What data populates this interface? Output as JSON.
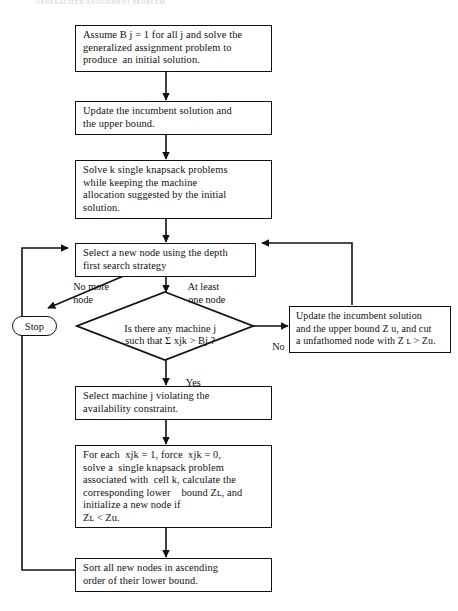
{
  "page": {
    "header_partial": "GENERALIZED ASSIGNMENT PROBLEM",
    "width": 458,
    "height": 611,
    "background": "#ffffff",
    "ink_color": "#111111"
  },
  "flowchart": {
    "type": "process-flow-diagram",
    "title": "Branch and bound algorithm for the generalized assignment problem",
    "nodes": [
      {
        "id": "init",
        "shape": "rectangle",
        "lines": [
          "Assume B j = 1 for all j and solve the",
          "generalized assignment problem to",
          "produce  an initial solution."
        ]
      },
      {
        "id": "update-incumbent",
        "shape": "rectangle",
        "lines": [
          "Update the incumbent solution and",
          "the upper bound."
        ]
      },
      {
        "id": "solve-knapsack",
        "shape": "rectangle",
        "lines": [
          "Solve k single knapsack problems",
          "while keeping the machine",
          "allocation suggested by the initial",
          "solution."
        ]
      },
      {
        "id": "select-node",
        "shape": "rectangle",
        "lines": [
          "Select a new node using the depth",
          "first search strategy"
        ]
      },
      {
        "id": "decision",
        "shape": "diamond",
        "lines": [
          "Is there any machine j",
          "such that Σ xjk > Bj ?"
        ]
      },
      {
        "id": "stop",
        "shape": "rounded-terminator",
        "lines": [
          "Stop"
        ]
      },
      {
        "id": "update-bound-cut",
        "shape": "rectangle",
        "lines": [
          "Update the incumbent solution",
          "and the upper bound Z u, and cut",
          "a unfathomed node with Z ʟ > Zu."
        ]
      },
      {
        "id": "select-machine",
        "shape": "rectangle",
        "lines": [
          "Select machine j violating the",
          "availability constraint."
        ]
      },
      {
        "id": "for-each",
        "shape": "rectangle",
        "lines": [
          "For each  xjk = 1, force  xjk = 0,",
          "solve a  single knapsack problem",
          "associated with  cell k, calculate the",
          "corresponding lower    bound Zʟ, and",
          "initialize a new node if",
          "Zʟ < Zu."
        ]
      },
      {
        "id": "sort-nodes",
        "shape": "rectangle",
        "lines": [
          "Sort all new nodes in ascending",
          "order of their lower bound."
        ]
      }
    ],
    "edge_labels": [
      {
        "id": "no-more-node",
        "lines": [
          "No more",
          "node"
        ]
      },
      {
        "id": "at-least-one-node",
        "lines": [
          "At least",
          "one node"
        ]
      },
      {
        "id": "no",
        "lines": [
          "No"
        ]
      },
      {
        "id": "yes",
        "lines": [
          "Yes"
        ]
      }
    ]
  }
}
